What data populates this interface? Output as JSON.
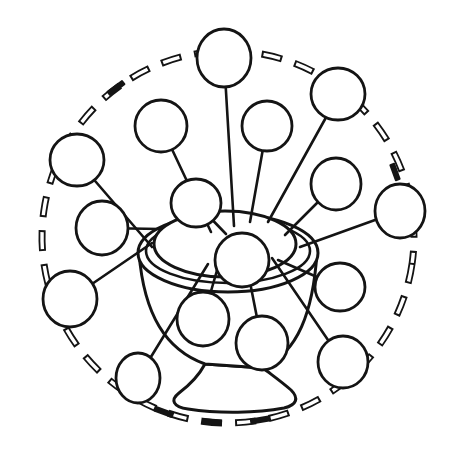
{
  "figure": {
    "alt": "Hand-drawn black ink line illustration of a pedestal bowl with sixteen empty round bubbles radiating from it on thin sticks, all enclosed by a large hand-drawn dashed circular border",
    "kind": "coloring-book style radial bubble drawing",
    "ink_color": "#141414",
    "background_color": "#ffffff",
    "bubble_count": 16,
    "stick_count": 15,
    "border_style": "dashed circle of hollow and solid dashes"
  }
}
